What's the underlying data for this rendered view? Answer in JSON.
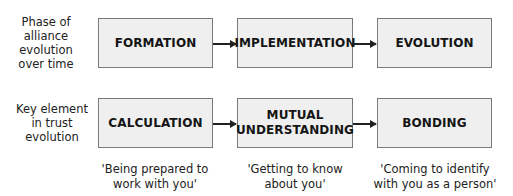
{
  "rows": [
    {
      "label": "Phase of alliance evolution over time",
      "label_lines": [
        "Phase of",
        "alliance",
        "evolution",
        "over time"
      ],
      "boxes": [
        "FORMATION",
        "IMPLEMENTATION",
        "EVOLUTION"
      ]
    },
    {
      "label": "Key element in trust evolution",
      "label_lines": [
        "Key element",
        "in trust",
        "evolution"
      ],
      "boxes": [
        "CALCULATION",
        "MUTUAL UNDERSTANDING",
        "BONDING"
      ],
      "box_lines": [
        [
          "CALCULATION"
        ],
        [
          "MUTUAL",
          "UNDERSTANDING"
        ],
        [
          "BONDING"
        ]
      ],
      "captions": [
        [
          "'Being prepared to",
          "work with you'"
        ],
        [
          "'Getting to know",
          "about you'"
        ],
        [
          "'Coming to identify",
          "with you as a person'"
        ]
      ]
    }
  ],
  "colors": {
    "box_fill": "#efefef",
    "box_border": "#7a7a7a",
    "arrow": "#222222"
  }
}
